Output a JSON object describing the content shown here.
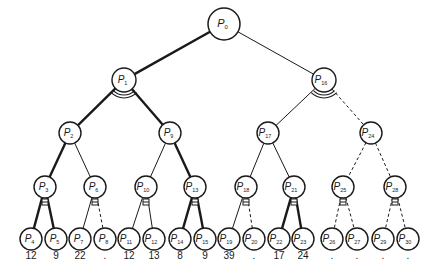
{
  "diagram": {
    "type": "binary-tree",
    "nodes": [
      {
        "id": "P0",
        "label": "P",
        "sub": "0",
        "x": 224,
        "y": 24,
        "r": 16,
        "level": 0
      },
      {
        "id": "P1",
        "label": "P",
        "sub": "1",
        "x": 124,
        "y": 80,
        "r": 12,
        "level": 1
      },
      {
        "id": "P16",
        "label": "P",
        "sub": "16",
        "x": 324,
        "y": 80,
        "r": 12,
        "level": 1
      },
      {
        "id": "P2",
        "label": "P",
        "sub": "2",
        "x": 70,
        "y": 133,
        "r": 11,
        "level": 2
      },
      {
        "id": "P9",
        "label": "P",
        "sub": "9",
        "x": 170,
        "y": 133,
        "r": 11,
        "level": 2
      },
      {
        "id": "P17",
        "label": "P",
        "sub": "17",
        "x": 268,
        "y": 133,
        "r": 11,
        "level": 2
      },
      {
        "id": "P24",
        "label": "P",
        "sub": "24",
        "x": 371,
        "y": 133,
        "r": 11,
        "level": 2
      },
      {
        "id": "P3",
        "label": "P",
        "sub": "3",
        "x": 45,
        "y": 187,
        "r": 11,
        "level": 3
      },
      {
        "id": "P6",
        "label": "P",
        "sub": "6",
        "x": 95,
        "y": 187,
        "r": 11,
        "level": 3
      },
      {
        "id": "P10",
        "label": "P",
        "sub": "10",
        "x": 146,
        "y": 187,
        "r": 11,
        "level": 3
      },
      {
        "id": "P13",
        "label": "P",
        "sub": "13",
        "x": 195,
        "y": 187,
        "r": 11,
        "level": 3
      },
      {
        "id": "P18",
        "label": "P",
        "sub": "18",
        "x": 246,
        "y": 187,
        "r": 11,
        "level": 3
      },
      {
        "id": "P21",
        "label": "P",
        "sub": "21",
        "x": 294,
        "y": 187,
        "r": 11,
        "level": 3
      },
      {
        "id": "P25",
        "label": "P",
        "sub": "25",
        "x": 343,
        "y": 187,
        "r": 11,
        "level": 3
      },
      {
        "id": "P28",
        "label": "P",
        "sub": "28",
        "x": 395,
        "y": 187,
        "r": 11,
        "level": 3
      },
      {
        "id": "P4",
        "label": "P",
        "sub": "4",
        "x": 31,
        "y": 239,
        "r": 11,
        "level": 4,
        "value": "12"
      },
      {
        "id": "P5",
        "label": "P",
        "sub": "5",
        "x": 56,
        "y": 239,
        "r": 11,
        "level": 4,
        "value": "9"
      },
      {
        "id": "P7",
        "label": "P",
        "sub": "7",
        "x": 80,
        "y": 239,
        "r": 11,
        "level": 4,
        "value": "22"
      },
      {
        "id": "P8",
        "label": "P",
        "sub": "8",
        "x": 105,
        "y": 239,
        "r": 11,
        "level": 4,
        "value": "."
      },
      {
        "id": "P11",
        "label": "P",
        "sub": "11",
        "x": 129,
        "y": 239,
        "r": 11,
        "level": 4,
        "value": "12"
      },
      {
        "id": "P12",
        "label": "P",
        "sub": "12",
        "x": 154,
        "y": 239,
        "r": 11,
        "level": 4,
        "value": "13"
      },
      {
        "id": "P14",
        "label": "P",
        "sub": "14",
        "x": 180,
        "y": 239,
        "r": 11,
        "level": 4,
        "value": "8"
      },
      {
        "id": "P15",
        "label": "P",
        "sub": "15",
        "x": 205,
        "y": 239,
        "r": 11,
        "level": 4,
        "value": "9"
      },
      {
        "id": "P19",
        "label": "P",
        "sub": "19",
        "x": 229,
        "y": 239,
        "r": 11,
        "level": 4,
        "value": "39"
      },
      {
        "id": "P20",
        "label": "P",
        "sub": "20",
        "x": 254,
        "y": 239,
        "r": 11,
        "level": 4,
        "value": "."
      },
      {
        "id": "P22",
        "label": "P",
        "sub": "22",
        "x": 279,
        "y": 239,
        "r": 11,
        "level": 4,
        "value": "17"
      },
      {
        "id": "P23",
        "label": "P",
        "sub": "23",
        "x": 303,
        "y": 239,
        "r": 11,
        "level": 4,
        "value": "24"
      },
      {
        "id": "P26",
        "label": "P",
        "sub": "26",
        "x": 332,
        "y": 239,
        "r": 11,
        "level": 4,
        "value": "."
      },
      {
        "id": "P27",
        "label": "P",
        "sub": "27",
        "x": 357,
        "y": 239,
        "r": 11,
        "level": 4,
        "value": "."
      },
      {
        "id": "P29",
        "label": "P",
        "sub": "29",
        "x": 383,
        "y": 239,
        "r": 11,
        "level": 4,
        "value": "."
      },
      {
        "id": "P30",
        "label": "P",
        "sub": "30",
        "x": 408,
        "y": 239,
        "r": 11,
        "level": 4,
        "value": "."
      }
    ],
    "edges": [
      {
        "from": "P0",
        "to": "P1",
        "style": "thick"
      },
      {
        "from": "P0",
        "to": "P16",
        "style": "thin"
      },
      {
        "from": "P1",
        "to": "P2",
        "style": "thick"
      },
      {
        "from": "P1",
        "to": "P9",
        "style": "thick"
      },
      {
        "from": "P16",
        "to": "P17",
        "style": "thin"
      },
      {
        "from": "P16",
        "to": "P24",
        "style": "dashed"
      },
      {
        "from": "P2",
        "to": "P3",
        "style": "thick"
      },
      {
        "from": "P2",
        "to": "P6",
        "style": "thin"
      },
      {
        "from": "P9",
        "to": "P10",
        "style": "thin"
      },
      {
        "from": "P9",
        "to": "P13",
        "style": "thick"
      },
      {
        "from": "P17",
        "to": "P18",
        "style": "thin"
      },
      {
        "from": "P17",
        "to": "P21",
        "style": "thin"
      },
      {
        "from": "P24",
        "to": "P25",
        "style": "dashed"
      },
      {
        "from": "P24",
        "to": "P28",
        "style": "dashed"
      },
      {
        "from": "P3",
        "to": "P4",
        "style": "thick"
      },
      {
        "from": "P3",
        "to": "P5",
        "style": "thick"
      },
      {
        "from": "P6",
        "to": "P7",
        "style": "thin"
      },
      {
        "from": "P6",
        "to": "P8",
        "style": "dashed"
      },
      {
        "from": "P10",
        "to": "P11",
        "style": "thin"
      },
      {
        "from": "P10",
        "to": "P12",
        "style": "thin"
      },
      {
        "from": "P13",
        "to": "P14",
        "style": "thick"
      },
      {
        "from": "P13",
        "to": "P15",
        "style": "thick"
      },
      {
        "from": "P18",
        "to": "P19",
        "style": "thin"
      },
      {
        "from": "P18",
        "to": "P20",
        "style": "dashed"
      },
      {
        "from": "P21",
        "to": "P22",
        "style": "thick"
      },
      {
        "from": "P21",
        "to": "P23",
        "style": "thick"
      },
      {
        "from": "P25",
        "to": "P26",
        "style": "dashed"
      },
      {
        "from": "P25",
        "to": "P27",
        "style": "dashed"
      },
      {
        "from": "P28",
        "to": "P29",
        "style": "dashed"
      },
      {
        "from": "P28",
        "to": "P30",
        "style": "dashed"
      }
    ],
    "sync_arcs": [
      {
        "node": "P1",
        "kind": "double-arc"
      },
      {
        "node": "P16",
        "kind": "double-arc"
      },
      {
        "node": "P3",
        "kind": "small-bar"
      },
      {
        "node": "P6",
        "kind": "small-bar"
      },
      {
        "node": "P10",
        "kind": "small-bar"
      },
      {
        "node": "P13",
        "kind": "small-bar"
      },
      {
        "node": "P18",
        "kind": "small-bar"
      },
      {
        "node": "P21",
        "kind": "small-bar"
      },
      {
        "node": "P25",
        "kind": "small-bar"
      },
      {
        "node": "P28",
        "kind": "small-bar"
      }
    ],
    "styles": {
      "stroke_color": "#1a1a1a",
      "thick_width": 2.4,
      "thin_width": 1.0,
      "dashed_width": 1.0
    }
  }
}
